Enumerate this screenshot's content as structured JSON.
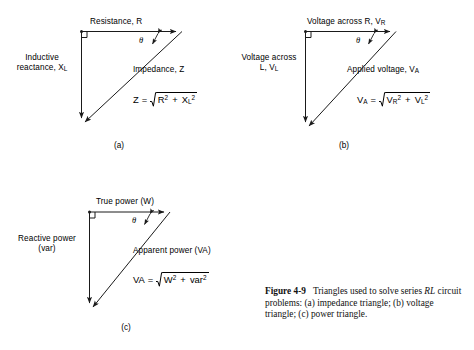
{
  "figure": {
    "caption_label": "Figure 4-9",
    "caption_text": "Triangles used to solve series ",
    "caption_italic": "RL",
    "caption_rest": " circuit problems: (a) impedance triangle; (b) voltage triangle; (c) power triangle."
  },
  "panels": {
    "a": {
      "tag": "(a)",
      "horizontal_label": "Resistance, R",
      "vertical_label_line1": "Inductive",
      "vertical_label_line2": "reactance, X",
      "vertical_label_sub": "L",
      "hypotenuse_label": "Impedance, Z",
      "angle_symbol": "θ",
      "formula": {
        "lhs": "Z",
        "equals": "=",
        "radicand_term1": "R",
        "radicand_term1_sup": "2",
        "plus": "+",
        "radicand_term2": "X",
        "radicand_term2_sub": "L",
        "radicand_term2_sup": "2"
      }
    },
    "b": {
      "tag": "(b)",
      "horizontal_label": "Voltage across R, V",
      "horizontal_label_sub": "R",
      "vertical_label_line1": "Voltage across",
      "vertical_label_line2": "L, V",
      "vertical_label_sub": "L",
      "hypotenuse_label": "Applied voltage, V",
      "hypotenuse_label_sub": "A",
      "angle_symbol": "θ",
      "formula": {
        "lhs": "V",
        "lhs_sub": "A",
        "equals": "=",
        "radicand_term1": "V",
        "radicand_term1_sub": "R",
        "radicand_term1_sup": "2",
        "plus": "+",
        "radicand_term2": "V",
        "radicand_term2_sub": "L",
        "radicand_term2_sup": "2"
      }
    },
    "c": {
      "tag": "(c)",
      "horizontal_label": "True power (W)",
      "vertical_label_line1": "Reactive power",
      "vertical_label_line2": "(var)",
      "hypotenuse_label": "Apparent power (VA)",
      "angle_symbol": "θ",
      "formula": {
        "lhs": "VA",
        "equals": "=",
        "radicand_term1": "W",
        "radicand_term1_sup": "2",
        "plus": "+",
        "radicand_term2": "var",
        "radicand_term2_sup": "2"
      }
    }
  },
  "style": {
    "line_color": "#1a1a1a",
    "background": "#ffffff"
  }
}
